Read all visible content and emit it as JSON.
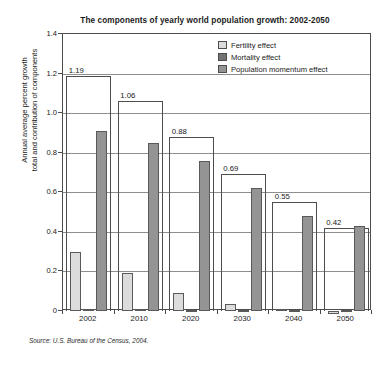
{
  "chart_data": {
    "type": "bar",
    "title": "The components of yearly world population growth: 2002-2050",
    "xlabel": "",
    "ylabel": "Annual average percent growth\ntotal and contribution of components",
    "ylabel_line1": "Annual average percent growth",
    "ylabel_line2": "total and contribution of components",
    "categories": [
      "2002",
      "2010",
      "2020",
      "2030",
      "2040",
      "2050"
    ],
    "ylim": [
      0,
      1.4
    ],
    "yticks": [
      "0",
      "0.2",
      "0.4",
      "0.6",
      "0.8",
      "1.0",
      "1.2",
      "1.4"
    ],
    "ytick_values": [
      0,
      0.2,
      0.4,
      0.6,
      0.8,
      1.0,
      1.2,
      1.4
    ],
    "grid": true,
    "legend_position": "top-right",
    "series": [
      {
        "name": "Fertility effect",
        "color": "#dcdcdc",
        "values": [
          0.3,
          0.19,
          0.09,
          0.035,
          0.012,
          -0.015
        ]
      },
      {
        "name": "Mortality effect",
        "color": "#737373",
        "values": [
          0.01,
          0.008,
          0.006,
          0.005,
          0.004,
          0.003
        ]
      },
      {
        "name": "Population momentum effect",
        "color": "#949494",
        "values": [
          0.91,
          0.85,
          0.76,
          0.62,
          0.48,
          0.43
        ]
      }
    ],
    "totals": {
      "name": "Total growth",
      "values": [
        1.19,
        1.06,
        0.88,
        0.69,
        0.55,
        0.42
      ],
      "labels": [
        "1.19",
        "1.06",
        "0.88",
        "0.69",
        "0.55",
        "0.42"
      ]
    },
    "source": "Source: U.S. Bureau of the Census, 2004."
  }
}
